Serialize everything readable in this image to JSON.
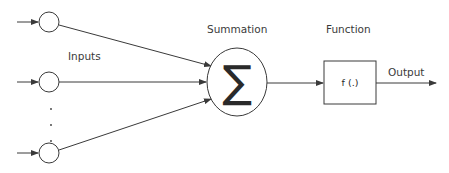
{
  "labels": {
    "inputs": "Inputs",
    "summation": "Summation",
    "function": "Function",
    "output": "Output"
  },
  "symbols": {
    "sum": "∑",
    "function": "f (.)"
  },
  "dots": ".",
  "colors": {
    "stroke": "#3a3a3a",
    "text": "#3a3a3a",
    "background": "#ffffff"
  }
}
